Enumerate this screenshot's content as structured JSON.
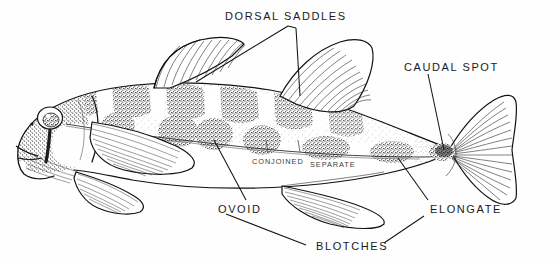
{
  "figure": {
    "background_color": "#fefefe",
    "ink_color": "#111111",
    "pigment_color": "#2a2a2a"
  },
  "labels": {
    "dorsal_saddles": "DORSAL SADDLES",
    "caudal_spot": "CAUDAL SPOT",
    "conjoined": "CONJOINED",
    "separate": "SEPARATE",
    "ovoid": "OVOID",
    "elongate": "ELONGATE",
    "blotches": "BLOTCHES"
  },
  "anatomy": {
    "parts": [
      "head",
      "eye",
      "operculum",
      "first-dorsal-fin",
      "second-dorsal-fin",
      "pectoral-fin",
      "pelvic-fin",
      "anal-fin",
      "caudal-fin",
      "caudal-peduncle",
      "lateral-line"
    ]
  },
  "markings": {
    "dorsal_saddle_count": 6,
    "lateral_blotch_count": 7,
    "blotch_shapes": [
      "ovoid",
      "elongate"
    ],
    "blotch_arrangement": [
      "conjoined",
      "separate"
    ],
    "caudal_spot_present": true
  }
}
